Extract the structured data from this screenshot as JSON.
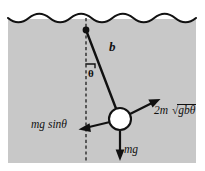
{
  "figure": {
    "background_color": "#ffffff",
    "water_fill_color": "#c8c8c8",
    "stroke_color": "#111111",
    "bob_fill_color": "#ffffff"
  },
  "labels": {
    "rod_length": "b",
    "angle": "θ",
    "tangential_gravity": "mg sinθ",
    "weight": "mg",
    "drag_coefficient": "2m",
    "drag_radical_symbol": "√",
    "drag_radicand": "gbθ"
  },
  "geometry": {
    "water_surface_y": 18,
    "water_left_x": 8,
    "water_right_x": 196,
    "water_bottom_y": 163,
    "wave_count": 9,
    "wave_amplitude": 4,
    "pivot_x": 86,
    "pivot_y": 30,
    "bob_cx": 120,
    "bob_cy": 119,
    "bob_r": 11,
    "dashed_line_x": 86,
    "dashed_line_top_y": 18,
    "dashed_line_bottom_y": 163,
    "rod_angle_from_vertical_deg": 21
  },
  "vectors": [
    {
      "name": "weight-vector",
      "label": "mg",
      "direction": "down",
      "from_x": 120,
      "from_y": 131,
      "to_x": 120,
      "to_y": 160
    },
    {
      "name": "tangential-gravity-vector",
      "label": "mg sinθ",
      "direction": "down-left",
      "from_x": 109,
      "from_y": 122,
      "to_x": 79,
      "to_y": 128
    },
    {
      "name": "drag-vector",
      "label": "2m √gbθ",
      "direction": "up-right",
      "from_x": 130,
      "from_y": 114,
      "to_x": 160,
      "to_y": 100
    }
  ]
}
